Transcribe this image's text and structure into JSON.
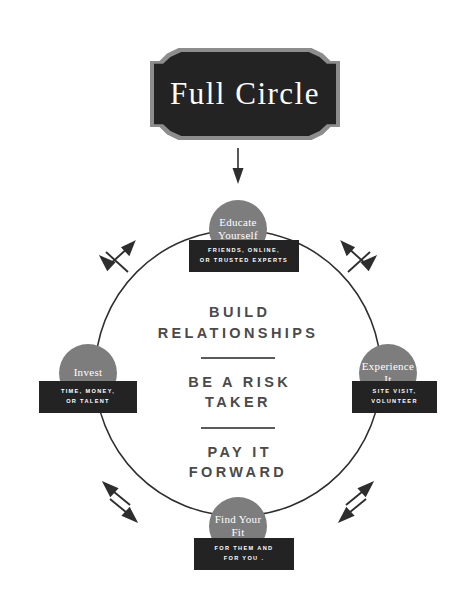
{
  "banner": {
    "title": "Full Circle",
    "colors": {
      "plate": "#232323",
      "border": "#8d8d8d",
      "text": "#ffffff"
    }
  },
  "diagram": {
    "type": "cycle",
    "ring_color": "#2e2e2e",
    "node_color": "#7d7d7d",
    "caption_color": "#232323",
    "entry_arrow": "down-arrow-icon",
    "nodes": [
      {
        "id": "educate-yourself",
        "position": "top",
        "label": "Educate\nYourself",
        "caption": "FRIENDS, ONLINE,\nOR TRUSTED EXPERTS"
      },
      {
        "id": "experience-it",
        "position": "right",
        "label": "Experience\nIt",
        "caption": "SITE VISIT,\nVOLUNTEER"
      },
      {
        "id": "find-your-fit",
        "position": "bottom",
        "label": "Find\nYour Fit",
        "caption": "FOR THEM AND\nFOR YOU ."
      },
      {
        "id": "invest",
        "position": "left",
        "label": "Invest",
        "caption": "TIME, MONEY,\nOR TALENT"
      }
    ],
    "arrow_pairs": [
      {
        "id": "top-left-arrows",
        "position": "top-left"
      },
      {
        "id": "top-right-arrows",
        "position": "top-right"
      },
      {
        "id": "bottom-left-arrows",
        "position": "bottom-left"
      },
      {
        "id": "bottom-right-arrows",
        "position": "bottom-right"
      }
    ]
  },
  "center": {
    "text_color": "#4a4a4a",
    "lines": [
      "BUILD\nRELATIONSHIPS",
      "BE A RISK\nTAKER",
      "PAY IT\nFORWARD"
    ]
  }
}
